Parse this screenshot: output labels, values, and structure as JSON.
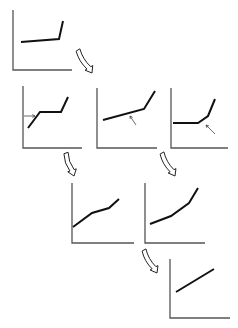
{
  "diagram": {
    "title": "",
    "colors": {
      "axis": "#555555",
      "curve": "#111111",
      "background": "#ffffff"
    },
    "panels": [
      {
        "id": "top",
        "axes": {
          "origin": [
            13,
            70
          ],
          "x_end": 72,
          "y_end": 10
        },
        "curve": [
          [
            21,
            42
          ],
          [
            59,
            39
          ],
          [
            63,
            21
          ]
        ],
        "pointers": []
      },
      {
        "id": "middle-left",
        "axes": {
          "origin": [
            23,
            148
          ],
          "x_end": 82,
          "y_end": 86
        },
        "curve": [
          [
            28,
            128
          ],
          [
            40,
            112
          ],
          [
            61,
            112
          ],
          [
            68,
            97
          ]
        ],
        "pointers": [
          {
            "from": [
              24,
              116
            ],
            "to": [
              35,
              116
            ]
          }
        ]
      },
      {
        "id": "middle-center",
        "axes": {
          "origin": [
            97,
            148
          ],
          "x_end": 157,
          "y_end": 88
        },
        "curve": [
          [
            103,
            120
          ],
          [
            144,
            109
          ],
          [
            155,
            91
          ]
        ],
        "pointers": [
          {
            "from": [
              136,
              125
            ],
            "to": [
              130,
              116
            ]
          }
        ]
      },
      {
        "id": "middle-right",
        "axes": {
          "origin": [
            171,
            148
          ],
          "x_end": 228,
          "y_end": 88
        },
        "curve": [
          [
            173,
            123
          ],
          [
            198,
            123
          ],
          [
            208,
            116
          ],
          [
            215,
            99
          ]
        ],
        "pointers": [
          {
            "from": [
              215,
              134
            ],
            "to": [
              206,
              125
            ]
          }
        ]
      },
      {
        "id": "lower-left",
        "axes": {
          "origin": [
            72,
            243
          ],
          "x_end": 134,
          "y_end": 183
        },
        "curve": [
          [
            73,
            227
          ],
          [
            92,
            213
          ],
          [
            109,
            208
          ],
          [
            119,
            199
          ]
        ],
        "pointers": []
      },
      {
        "id": "lower-right",
        "axes": {
          "origin": [
            145,
            243
          ],
          "x_end": 205,
          "y_end": 183
        },
        "curve": [
          [
            150,
            224
          ],
          [
            171,
            216
          ],
          [
            189,
            203
          ],
          [
            198,
            188
          ]
        ],
        "pointers": []
      },
      {
        "id": "bottom",
        "axes": {
          "origin": [
            170,
            318
          ],
          "x_end": 230,
          "y_end": 259
        },
        "curve": [
          [
            176,
            292
          ],
          [
            214,
            269
          ]
        ],
        "pointers": []
      }
    ],
    "flow_arrows": [
      {
        "id": "top-to-middle",
        "from": [
          78,
          50
        ],
        "to": [
          92,
          73
        ]
      },
      {
        "id": "middle-left-to-lower-left",
        "from": [
          66,
          153
        ],
        "to": [
          74,
          176
        ]
      },
      {
        "id": "middle-center-to-lower-right",
        "from": [
          162,
          153
        ],
        "to": [
          175,
          176
        ]
      },
      {
        "id": "lower-right-to-bottom",
        "from": [
          144,
          250
        ],
        "to": [
          157,
          273
        ]
      }
    ]
  }
}
